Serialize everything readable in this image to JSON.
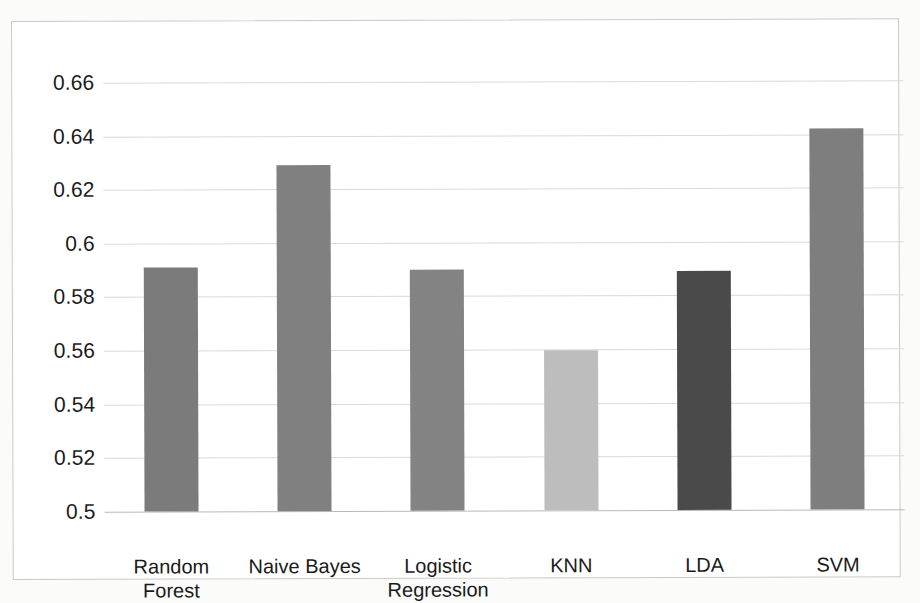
{
  "chart_data": {
    "type": "bar",
    "title": "",
    "subtitle": "",
    "xlabel": "",
    "ylabel": "",
    "categories": [
      "Random Forest",
      "Naive Bayes",
      "Logistic Regression",
      "KNN",
      "LDA",
      "SVM"
    ],
    "values": [
      0.591,
      0.629,
      0.59,
      0.5595,
      0.589,
      0.642
    ],
    "bar_colors": [
      "#7b7b7b",
      "#808080",
      "#838383",
      "#bdbdbd",
      "#4a4a4a",
      "#7e7e7e"
    ],
    "ylim": [
      0.5,
      0.67
    ],
    "ytick_values": [
      0.66,
      0.64,
      0.62,
      0.6,
      0.58,
      0.56,
      0.54,
      0.52,
      0.5
    ],
    "ytick_labels": [
      "0.66",
      "0.64",
      "0.62",
      "0.6",
      "0.58",
      "0.56",
      "0.54",
      "0.52",
      "0.5"
    ],
    "grid": true,
    "grid_axis": "y",
    "legend": false,
    "legend_position": "none",
    "axis_baseline_value": 0.5,
    "plot_background": "#ffffff",
    "gridline_color": "#d9d9d9",
    "border_color": "#c9c9c9",
    "text_color": "#1a1a1a"
  }
}
